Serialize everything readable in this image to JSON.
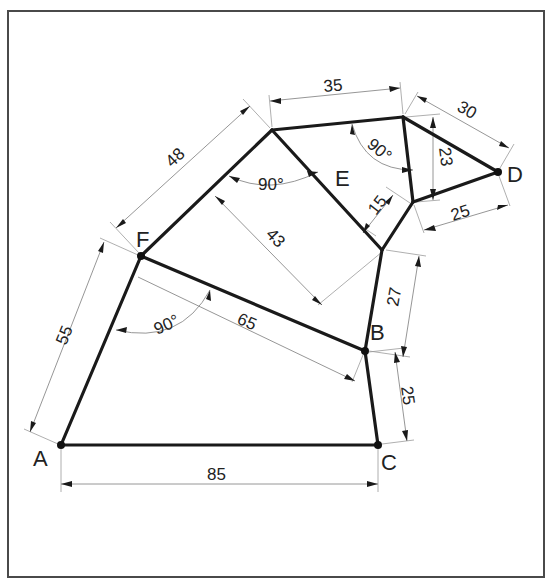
{
  "diagram": {
    "title": "",
    "points": [
      {
        "id": "A",
        "label": "A",
        "x": 61,
        "y": 445
      },
      {
        "id": "C",
        "label": "C",
        "x": 378,
        "y": 445
      },
      {
        "id": "B",
        "label": "B",
        "x": 365,
        "y": 351
      },
      {
        "id": "F",
        "label": "F",
        "x": 141,
        "y": 256
      },
      {
        "id": "D",
        "label": "D",
        "x": 498,
        "y": 172
      },
      {
        "id": "E",
        "label": "E",
        "x": 343,
        "y": 180
      }
    ],
    "labels": {
      "A": "A",
      "B": "B",
      "C": "C",
      "D": "D",
      "E": "E",
      "F": "F"
    },
    "dimensions": {
      "AC": "85",
      "AF": "55",
      "FB": "65",
      "BC": "25",
      "B_junction": "27",
      "F_top": "48",
      "top_edge": "35",
      "top_D": "30",
      "vertical_right": "23",
      "junction_D": "25",
      "E_offset": "15",
      "perp_43": "43"
    },
    "angles": {
      "at_F": "90°",
      "at_top_left": "90°",
      "at_top_right": "90°"
    }
  }
}
